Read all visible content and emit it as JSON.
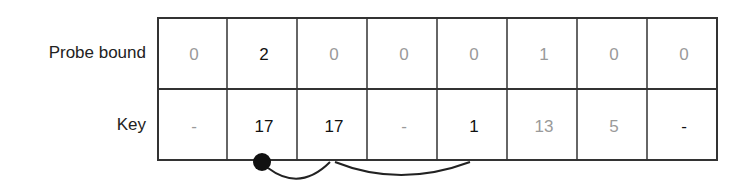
{
  "rows": [
    {
      "label": "Probe bound",
      "cells": [
        {
          "value": "0",
          "style": "dim"
        },
        {
          "value": "2",
          "style": "bold"
        },
        {
          "value": "0",
          "style": "dim"
        },
        {
          "value": "0",
          "style": "dim"
        },
        {
          "value": "0",
          "style": "dim"
        },
        {
          "value": "1",
          "style": "dim"
        },
        {
          "value": "0",
          "style": "dim"
        },
        {
          "value": "0",
          "style": "dim"
        }
      ]
    },
    {
      "label": "Key",
      "cells": [
        {
          "value": "-",
          "style": "dim"
        },
        {
          "value": "17",
          "style": "bold"
        },
        {
          "value": "17",
          "style": "bold"
        },
        {
          "value": "-",
          "style": "dim"
        },
        {
          "value": "1",
          "style": "bold"
        },
        {
          "value": "13",
          "style": "dim"
        },
        {
          "value": "5",
          "style": "dim"
        },
        {
          "value": "-",
          "style": "bold"
        }
      ]
    }
  ],
  "probe_chain": {
    "start_slot": 1,
    "hops": [
      2,
      4
    ]
  }
}
